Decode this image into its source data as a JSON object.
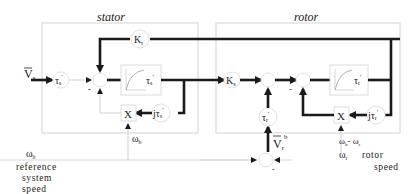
{
  "diagram": {
    "title_stator": "stator",
    "title_rotor": "rotor",
    "stator": {
      "input_label": "V",
      "input_sub": "s",
      "gain_tau_s": "τ",
      "gain_tau_s_sub": "s",
      "gain_tau_s_sup": "'",
      "lag_block": "τ",
      "lag_block_sub": "s",
      "lag_block_sup": "'",
      "multiplier": "X",
      "jtau_s": "jτ",
      "jtau_s_sub": "s",
      "jtau_s_sup": "'",
      "minus_sign": "-",
      "omega_b_label": "ω",
      "omega_b_sub": "b"
    },
    "coupling": {
      "Kr": "K",
      "Kr_sub": "r",
      "Ks": "K",
      "Ks_sub": "s"
    },
    "rotor": {
      "input_label": "V",
      "input_sub": "r",
      "input_sup": "b",
      "gain_tau_r": "τ",
      "gain_tau_r_sub": "r",
      "gain_tau_r_sup": "'",
      "lag_block": "τ",
      "lag_block_sub": "r",
      "lag_block_sup": "'",
      "multiplier": "X",
      "jtau_r": "jτ",
      "jtau_r_sub": "r",
      "jtau_r_sup": "'",
      "minus_sign": "-",
      "slip_label": "ω",
      "slip_sub1": "b",
      "slip_mid": "- ω",
      "slip_sub2": "r"
    },
    "reference": {
      "omega": "ω",
      "omega_sub": "b",
      "line1": "reference",
      "line2": "system",
      "line3": "speed"
    },
    "rotor_speed": {
      "omega": "ω",
      "omega_sub": "r",
      "line1": "rotor",
      "line2": "speed",
      "minus_sign": "-"
    }
  }
}
